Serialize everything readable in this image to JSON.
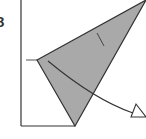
{
  "diagram": {
    "step_number": "8",
    "colors": {
      "paper_fill": "#a9a9a9",
      "line": "#333333",
      "background": "#ffffff"
    },
    "shapes": {
      "square_left_edge": {
        "x1": 21,
        "y1": 0,
        "x2": 21,
        "y2": 126
      },
      "square_bottom_edge": {
        "x1": 21,
        "y1": 126,
        "x2": 75,
        "y2": 126
      },
      "folded_flap": {
        "points": "37,60 146,0 75,126"
      },
      "reference_tick": {
        "x1": 26,
        "y1": 60,
        "x2": 37,
        "y2": 60
      },
      "crease_mark": {
        "x1": 97,
        "y1": 33,
        "x2": 104,
        "y2": 46
      }
    },
    "arrow": {
      "type": "fold-direction-arrow",
      "path": "M48,61 Q95,100 133,113"
    }
  }
}
